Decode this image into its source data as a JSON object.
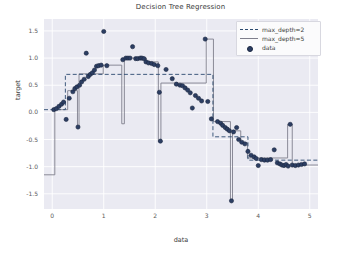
{
  "chart_data": {
    "type": "scatter",
    "title": "Decision Tree Regression",
    "xlabel": "data",
    "ylabel": "target",
    "xlim": [
      -0.16,
      5.16
    ],
    "ylim": [
      -1.78,
      1.72
    ],
    "xticks": [
      0,
      1,
      2,
      3,
      4,
      5
    ],
    "xtick_labels": [
      "0",
      "1",
      "2",
      "3",
      "4",
      "5"
    ],
    "yticks": [
      1.5,
      1.0,
      0.5,
      0.0,
      -0.5,
      -1.0,
      -1.5
    ],
    "ytick_labels": [
      "1.5",
      "1.0",
      "0.5",
      "0.0",
      "-0.5",
      "-1.0",
      "-1.5"
    ],
    "grid": true,
    "grid_color": "#ffffff",
    "axes_facecolor": "#eaeaf2",
    "legend_position": "upper right",
    "legend_entries": [
      "max_depth=2",
      "max_depth=5",
      "data"
    ],
    "colors": {
      "max_depth_2": "#2b4a6f",
      "max_depth_5": "#7f7f8c",
      "data_marker_face": "#2c3e63",
      "data_marker_edge": "#1b2740"
    },
    "series": [
      {
        "name": "data",
        "type": "scatter",
        "x": [
          0.03,
          0.08,
          0.13,
          0.18,
          0.22,
          0.27,
          0.33,
          0.4,
          0.44,
          0.48,
          0.5,
          0.53,
          0.57,
          0.62,
          0.66,
          0.7,
          0.74,
          0.78,
          0.82,
          0.86,
          0.9,
          0.95,
          1.0,
          1.06,
          1.37,
          1.43,
          1.47,
          1.51,
          1.56,
          1.62,
          1.66,
          1.71,
          1.74,
          1.78,
          1.82,
          1.87,
          1.93,
          1.98,
          2.05,
          2.08,
          2.1,
          2.21,
          2.33,
          2.41,
          2.48,
          2.53,
          2.58,
          2.63,
          2.68,
          2.72,
          2.78,
          2.84,
          2.9,
          2.97,
          3.02,
          3.09,
          3.21,
          3.27,
          3.31,
          3.36,
          3.4,
          3.44,
          3.48,
          3.52,
          3.58,
          3.62,
          3.68,
          3.74,
          3.8,
          3.86,
          3.92,
          3.96,
          4.0,
          4.06,
          4.12,
          4.18,
          4.24,
          4.31,
          4.37,
          4.42,
          4.46,
          4.5,
          4.54,
          4.58,
          4.62,
          4.66,
          4.72,
          4.78,
          4.84,
          4.9
        ],
        "y": [
          0.05,
          0.07,
          0.11,
          0.15,
          0.19,
          -0.13,
          0.26,
          0.38,
          0.44,
          0.47,
          -0.27,
          0.5,
          0.56,
          0.61,
          1.09,
          0.66,
          0.7,
          0.73,
          0.78,
          0.85,
          0.86,
          0.87,
          1.49,
          0.86,
          0.97,
          1.0,
          1.0,
          1.0,
          1.21,
          0.99,
          0.99,
          1.0,
          1.0,
          0.99,
          0.93,
          0.91,
          0.9,
          0.88,
          0.86,
          0.37,
          -0.53,
          0.79,
          0.62,
          0.52,
          0.5,
          0.49,
          0.45,
          0.41,
          0.36,
          0.08,
          0.31,
          0.26,
          0.21,
          1.35,
          0.2,
          -0.12,
          -0.17,
          -0.2,
          -0.24,
          -0.28,
          -0.31,
          -0.34,
          -1.63,
          -0.36,
          -0.28,
          -0.5,
          -0.55,
          -0.58,
          -0.72,
          -0.79,
          -0.82,
          -0.85,
          -0.98,
          -0.87,
          -0.88,
          -0.88,
          -0.87,
          -0.69,
          -0.93,
          -0.95,
          -0.97,
          -0.98,
          -0.96,
          -0.99,
          -0.22,
          -0.97,
          -0.98,
          -0.97,
          -0.96,
          -0.95
        ]
      },
      {
        "name": "max_depth=2",
        "type": "step",
        "style": "dashed",
        "steps": [
          {
            "x0": -0.16,
            "x1": 0.255,
            "y": 0.05
          },
          {
            "x0": 0.255,
            "x1": 3.12,
            "y": 0.7
          },
          {
            "x0": 3.12,
            "x1": 3.8,
            "y": -0.45
          },
          {
            "x0": 3.8,
            "x1": 5.16,
            "y": -0.88
          }
        ]
      },
      {
        "name": "max_depth=5",
        "type": "step",
        "style": "solid",
        "steps": [
          {
            "x0": -0.16,
            "x1": 0.05,
            "y": -1.15
          },
          {
            "x0": 0.05,
            "x1": 0.3,
            "y": 0.05
          },
          {
            "x0": 0.3,
            "x1": 0.49,
            "y": 0.4
          },
          {
            "x0": 0.49,
            "x1": 0.52,
            "y": -0.27
          },
          {
            "x0": 0.52,
            "x1": 0.99,
            "y": 0.71
          },
          {
            "x0": 0.99,
            "x1": 1.35,
            "y": 0.87
          },
          {
            "x0": 1.35,
            "x1": 1.4,
            "y": -0.21
          },
          {
            "x0": 1.4,
            "x1": 1.83,
            "y": 1.0
          },
          {
            "x0": 1.83,
            "x1": 2.06,
            "y": 0.93
          },
          {
            "x0": 2.06,
            "x1": 2.11,
            "y": -0.53
          },
          {
            "x0": 2.11,
            "x1": 2.99,
            "y": 0.54
          },
          {
            "x0": 2.99,
            "x1": 3.13,
            "y": 1.35
          },
          {
            "x0": 3.13,
            "x1": 3.46,
            "y": -0.17
          },
          {
            "x0": 3.46,
            "x1": 3.5,
            "y": -1.63
          },
          {
            "x0": 3.5,
            "x1": 3.66,
            "y": -0.34
          },
          {
            "x0": 3.66,
            "x1": 3.79,
            "y": -0.56
          },
          {
            "x0": 3.79,
            "x1": 4.57,
            "y": -0.84
          },
          {
            "x0": 4.57,
            "x1": 4.66,
            "y": -0.22
          },
          {
            "x0": 4.66,
            "x1": 5.16,
            "y": -0.97
          }
        ]
      }
    ]
  }
}
